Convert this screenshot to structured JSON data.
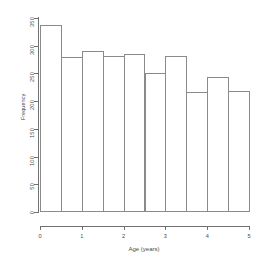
{
  "chart_data": {
    "type": "bar",
    "title": "",
    "subtitle": "",
    "xlabel": "Age (years)",
    "ylabel": "Frequency",
    "grid": false,
    "legend": null,
    "xlim": [
      0,
      5
    ],
    "ylim": [
      0,
      350
    ],
    "bin_width": 0.5,
    "bin_edges": [
      0,
      0.5,
      1,
      1.5,
      2,
      2.5,
      3,
      3.5,
      4,
      4.5,
      5
    ],
    "categories": [
      "0-0.5",
      "0.5-1",
      "1-1.5",
      "1.5-2",
      "2-2.5",
      "2.5-3",
      "3-3.5",
      "3.5-4",
      "4-4.5",
      "4.5-5"
    ],
    "values": [
      337,
      279,
      290,
      282,
      285,
      250,
      282,
      217,
      243,
      218
    ],
    "xticks": [
      "0",
      "1",
      "2",
      "3",
      "4",
      "5"
    ],
    "xtick_values": [
      0,
      1,
      2,
      3,
      4,
      5
    ],
    "yticks": [
      "0",
      "50",
      "100",
      "150",
      "200",
      "250",
      "300",
      "350"
    ],
    "ytick_values": [
      0,
      50,
      100,
      150,
      200,
      250,
      300,
      350
    ],
    "colors": {
      "bar_fill": "#ffffff",
      "bar_edge": "#8a8a8a",
      "axis": "#707070",
      "text": "#4a4a4a",
      "background": "#ffffff"
    }
  }
}
